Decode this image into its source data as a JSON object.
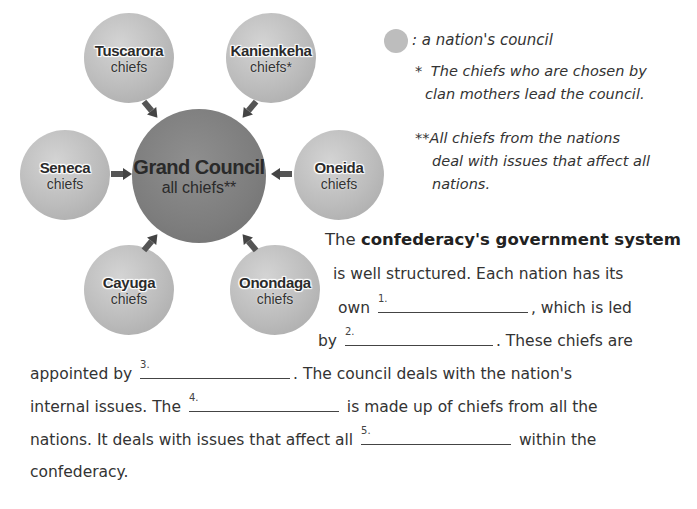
{
  "diagram": {
    "center": {
      "name": "Grand Council",
      "sub": "all chiefs**"
    },
    "nations": [
      {
        "name": "Tuscarora",
        "sub": "chiefs"
      },
      {
        "name": "Kanienkeha",
        "sub": "chiefs*"
      },
      {
        "name": "Seneca",
        "sub": "chiefs"
      },
      {
        "name": "Oneida",
        "sub": "chiefs"
      },
      {
        "name": "Cayuga",
        "sub": "chiefs"
      },
      {
        "name": "Onondaga",
        "sub": "chiefs"
      }
    ]
  },
  "legend": {
    "symbol_label": ": a nation's council",
    "note1_mark": "*",
    "note1_line1": "The chiefs who are chosen by",
    "note1_line2": "clan mothers lead the council.",
    "note2_mark": "**",
    "note2_line1": "All chiefs from the nations",
    "note2_line2": "deal with issues that affect all",
    "note2_line3": "nations."
  },
  "paragraph": {
    "l1_a": "The ",
    "l1_bold": "confederacy's government system",
    "l2": "is well structured.  Each nation has its",
    "l3_a": "own ",
    "l3_b": ", which is led",
    "l4_a": "by ",
    "l4_b": ".  These chiefs are",
    "l5_a": "appointed by ",
    "l5_b": ".  The council deals with the nation's",
    "l6_a": "internal issues.  The ",
    "l6_b": " is made up of chiefs from all the",
    "l7_a": "nations.  It deals with issues that affect all ",
    "l7_b": " within the",
    "l8": "confederacy."
  },
  "blanks": [
    {
      "num": "1.",
      "value": ""
    },
    {
      "num": "2.",
      "value": ""
    },
    {
      "num": "3.",
      "value": ""
    },
    {
      "num": "4.",
      "value": ""
    },
    {
      "num": "5.",
      "value": ""
    }
  ]
}
